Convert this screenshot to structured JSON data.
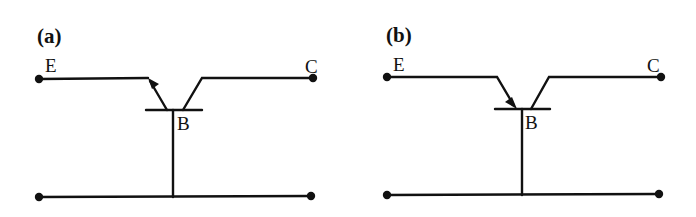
{
  "diagram": {
    "stroke_color": "#111111",
    "background": "#ffffff",
    "panels": [
      {
        "id": "a",
        "label": "(a)",
        "transistor_type": "PNP",
        "emitter_arrow": "outward-from-base",
        "terminals": {
          "emitter": "E",
          "collector": "C",
          "base": "B"
        }
      },
      {
        "id": "b",
        "label": "(b)",
        "transistor_type": "NPN",
        "emitter_arrow": "toward-base",
        "terminals": {
          "emitter": "E",
          "collector": "C",
          "base": "B"
        }
      }
    ]
  }
}
